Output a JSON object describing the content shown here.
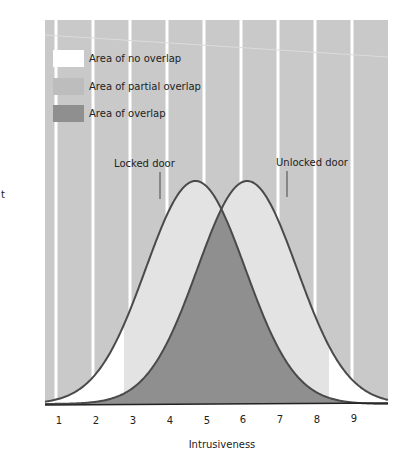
{
  "chart_data": {
    "type": "area",
    "title": "",
    "xlabel": "Intrusiveness",
    "ylabel_fragment": "t",
    "x_ticks": [
      "1",
      "2",
      "3",
      "4",
      "5",
      "6",
      "7",
      "8",
      "9"
    ],
    "xlim": [
      0.7,
      9.9
    ],
    "grid": "vertical white bands on gray background",
    "legend": [
      {
        "label": "Area of no overlap",
        "color": "#ffffff"
      },
      {
        "label": "Area of partial overlap",
        "color": "#bdbdbd"
      },
      {
        "label": "Area of overlap",
        "color": "#8f8f8f"
      }
    ],
    "legend_position": "top-left",
    "series": [
      {
        "name": "Locked door",
        "distribution": "normal",
        "mean": 4.7,
        "sd": 1.35,
        "peak_x": 4.7
      },
      {
        "name": "Unlocked door",
        "distribution": "normal",
        "mean": 6.1,
        "sd": 1.35,
        "peak_x": 6.1
      }
    ],
    "regions": {
      "no_overlap": "outer tails below x≈2.8 and above x≈8.3",
      "partial_overlap": "between x≈2.8 and x≈8.3 where only one curve covers",
      "overlap": "area under both curves"
    },
    "annotations": [
      {
        "text": "Locked door",
        "x": 4.3
      },
      {
        "text": "Unlocked door",
        "x": 7.2
      }
    ]
  },
  "colors": {
    "background_band": "#c9c9c9",
    "band_gap": "#ffffff",
    "partial": "#e3e3e3",
    "overlap": "#8f8f8f",
    "curve": "#4a4a4a"
  }
}
